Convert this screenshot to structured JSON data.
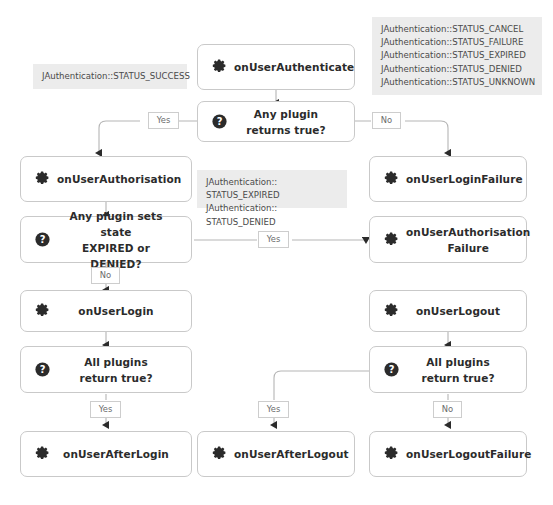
{
  "diagram": {
    "colors": {
      "node_border": "#c9c9c9",
      "node_fill": "#ffffff",
      "legend_fill": "#ececec",
      "legend_text": "#4a4a4a",
      "edge": "#b5b5b5",
      "label_text": "#6b6b6b",
      "node_text": "#2b2b2b",
      "icon": "#2b2b2b"
    },
    "nodes": [
      {
        "id": "onUserAuthenticate",
        "label": "onUserAuthenticate",
        "icon": "gear-icon",
        "type": "event"
      },
      {
        "id": "anyPluginReturnsTrue",
        "label": "Any plugin\nreturns true?",
        "icon": "question-mark-icon",
        "type": "decision"
      },
      {
        "id": "onUserAuthorisation",
        "label": "onUserAuthorisation",
        "icon": "gear-icon",
        "type": "event"
      },
      {
        "id": "onUserLoginFailure",
        "label": "onUserLoginFailure",
        "icon": "gear-icon",
        "type": "event"
      },
      {
        "id": "anyPluginSetsState",
        "label": "Any plugin sets state\nEXPIRED or DENIED?",
        "icon": "question-mark-icon",
        "type": "decision"
      },
      {
        "id": "onUserAuthorisationFailure",
        "label": "onUserAuthorisation\nFailure",
        "icon": "gear-icon",
        "type": "event"
      },
      {
        "id": "onUserLogin",
        "label": "onUserLogin",
        "icon": "gear-icon",
        "type": "event"
      },
      {
        "id": "onUserLogout",
        "label": "onUserLogout",
        "icon": "gear-icon",
        "type": "event"
      },
      {
        "id": "allPluginsReturnTrueLogin",
        "label": "All plugins\nreturn true?",
        "icon": "question-mark-icon",
        "type": "decision"
      },
      {
        "id": "allPluginsReturnTrueLogout",
        "label": "All plugins\nreturn true?",
        "icon": "question-mark-icon",
        "type": "decision"
      },
      {
        "id": "onUserAfterLogin",
        "label": "onUserAfterLogin",
        "icon": "gear-icon",
        "type": "event"
      },
      {
        "id": "onUserAfterLogout",
        "label": "onUserAfterLogout",
        "icon": "gear-icon",
        "type": "event"
      },
      {
        "id": "onUserLogoutFailure",
        "label": "onUserLogoutFailure",
        "icon": "gear-icon",
        "type": "event"
      }
    ],
    "legends": [
      {
        "id": "legend-success",
        "text": "JAuthentication::STATUS_SUCCESS"
      },
      {
        "id": "legend-failures",
        "text": "JAuthentication::STATUS_CANCEL\nJAuthentication::STATUS_FAILURE\nJAuthentication::STATUS_EXPIRED\nJAuthentication::STATUS_DENIED\nJAuthentication::STATUS_UNKNOWN"
      },
      {
        "id": "legend-expired-denied",
        "text": "JAuthentication:: STATUS_EXPIRED\nJAuthentication:: STATUS_DENIED"
      }
    ],
    "edge_labels": [
      {
        "id": "auth-yes",
        "text": "Yes",
        "from": "anyPluginReturnsTrue",
        "to": "onUserAuthorisation"
      },
      {
        "id": "auth-no",
        "text": "No",
        "from": "anyPluginReturnsTrue",
        "to": "onUserLoginFailure"
      },
      {
        "id": "state-yes",
        "text": "Yes",
        "from": "anyPluginSetsState",
        "to": "onUserAuthorisationFailure"
      },
      {
        "id": "state-no",
        "text": "No",
        "from": "anyPluginSetsState",
        "to": "onUserLogin"
      },
      {
        "id": "login-yes",
        "text": "Yes",
        "from": "allPluginsReturnTrueLogin",
        "to": "onUserAfterLogin"
      },
      {
        "id": "logout-yes",
        "text": "Yes",
        "from": "allPluginsReturnTrueLogout",
        "to": "onUserAfterLogout"
      },
      {
        "id": "logout-no",
        "text": "No",
        "from": "allPluginsReturnTrueLogout",
        "to": "onUserLogoutFailure"
      }
    ]
  }
}
